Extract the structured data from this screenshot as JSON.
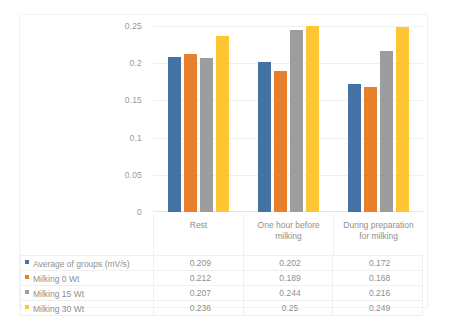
{
  "chart_data": {
    "type": "bar",
    "title": "",
    "xlabel": "",
    "ylabel": "",
    "ylim": [
      0,
      0.25
    ],
    "yticks": [
      "0",
      "0.05",
      "0.1",
      "0.15",
      "0.2",
      "0.25"
    ],
    "ytick_values": [
      0,
      0.05,
      0.1,
      0.15,
      0.2,
      0.25
    ],
    "grid": true,
    "legend_position": "data-table-left",
    "categories": [
      "Rest",
      "One hour before milking",
      "During preparation for milking"
    ],
    "category_lines": [
      [
        "Rest"
      ],
      [
        "One hour before",
        "milking"
      ],
      [
        "During preparation",
        "for milking"
      ]
    ],
    "series": [
      {
        "name": "Average of groups (mV/s)",
        "color": "#4472A4",
        "values": [
          0.209,
          0.202,
          0.172
        ],
        "labels": [
          "0.209",
          "0.202",
          "0.172"
        ]
      },
      {
        "name": "Milking 0 Wt",
        "color": "#E8802B",
        "values": [
          0.212,
          0.189,
          0.168
        ],
        "labels": [
          "0.212",
          "0.189",
          "0.168"
        ]
      },
      {
        "name": "Milking 15 Wt",
        "color": "#9D9D9D",
        "values": [
          0.207,
          0.244,
          0.216
        ],
        "labels": [
          "0.207",
          "0.244",
          "0.216"
        ]
      },
      {
        "name": "Milking 30 Wt",
        "color": "#FFC633",
        "values": [
          0.236,
          0.25,
          0.249
        ],
        "labels": [
          "0.236",
          "0.25",
          "0.249"
        ]
      }
    ]
  }
}
